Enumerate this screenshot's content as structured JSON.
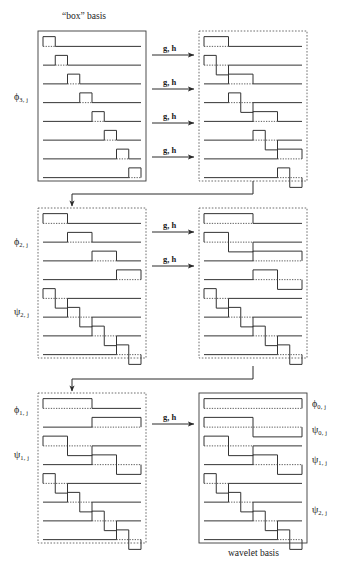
{
  "figure": {
    "title_top": "“box” basis",
    "caption_bottom": "wavelet basis",
    "operator_label": "g, h"
  },
  "labels": {
    "phi3": "ϕ",
    "phi3_sub": "3, j",
    "phi2": "ϕ",
    "phi2_sub": "2, j",
    "psi2": "ψ",
    "psi2_sub": "2, j",
    "phi1": "ϕ",
    "phi1_sub": "1, j",
    "psi1": "ψ",
    "psi1_sub": "1, j",
    "phi0r": "ϕ",
    "phi0r_sub": "0, j",
    "psi0r": "ψ",
    "psi0r_sub": "0, j",
    "psi1r": "ψ",
    "psi1r_sub": "1, j",
    "psi2r": "ψ",
    "psi2r_sub": "2, j"
  },
  "colors": {
    "ink": "#2a2a2a",
    "solid_box": "#3a3a3a",
    "dashed_box": "#4a4a4a",
    "baseline": "#444444",
    "wave": "#333333"
  },
  "chart_data": {
    "type": "line",
    "xlabel": "",
    "ylabel": "",
    "panels": [
      {
        "name": "row1-left",
        "label": "ϕ 3, j",
        "border": "solid",
        "title": "“box” basis",
        "x": 38,
        "y": 31,
        "w": 108,
        "h": 150,
        "functions": [
          {
            "kind": "box",
            "start": 0.0,
            "width": 0.125,
            "sign": 1
          },
          {
            "kind": "box",
            "start": 0.125,
            "width": 0.125,
            "sign": 1
          },
          {
            "kind": "box",
            "start": 0.25,
            "width": 0.125,
            "sign": 1
          },
          {
            "kind": "box",
            "start": 0.375,
            "width": 0.125,
            "sign": 1
          },
          {
            "kind": "box",
            "start": 0.5,
            "width": 0.125,
            "sign": 1
          },
          {
            "kind": "box",
            "start": 0.625,
            "width": 0.125,
            "sign": 1
          },
          {
            "kind": "box",
            "start": 0.75,
            "width": 0.125,
            "sign": 1
          },
          {
            "kind": "box",
            "start": 0.875,
            "width": 0.125,
            "sign": 1
          }
        ]
      },
      {
        "name": "row1-right",
        "border": "dashed",
        "x": 199,
        "y": 31,
        "w": 108,
        "h": 150,
        "functions": [
          {
            "kind": "box",
            "start": 0.0,
            "width": 0.25,
            "sign": 1
          },
          {
            "kind": "wave",
            "start": 0.0,
            "width": 0.25,
            "sign": 1
          },
          {
            "kind": "box",
            "start": 0.25,
            "width": 0.25,
            "sign": 1
          },
          {
            "kind": "wave",
            "start": 0.25,
            "width": 0.25,
            "sign": 1
          },
          {
            "kind": "box",
            "start": 0.5,
            "width": 0.25,
            "sign": 1
          },
          {
            "kind": "wave",
            "start": 0.5,
            "width": 0.25,
            "sign": 1
          },
          {
            "kind": "box",
            "start": 0.75,
            "width": 0.25,
            "sign": 1
          },
          {
            "kind": "wave",
            "start": 0.75,
            "width": 0.25,
            "sign": 1
          }
        ]
      },
      {
        "name": "row2-left",
        "labels": [
          "ϕ 2, j",
          "ψ 2, j"
        ],
        "border": "dashed",
        "x": 38,
        "y": 208,
        "w": 108,
        "h": 150,
        "functions": [
          {
            "kind": "box",
            "start": 0.0,
            "width": 0.25,
            "sign": 1
          },
          {
            "kind": "box",
            "start": 0.25,
            "width": 0.25,
            "sign": 1
          },
          {
            "kind": "box",
            "start": 0.5,
            "width": 0.25,
            "sign": 1
          },
          {
            "kind": "box",
            "start": 0.75,
            "width": 0.25,
            "sign": 1
          },
          {
            "kind": "wave",
            "start": 0.0,
            "width": 0.25,
            "sign": 1
          },
          {
            "kind": "wave",
            "start": 0.25,
            "width": 0.25,
            "sign": 1
          },
          {
            "kind": "wave",
            "start": 0.5,
            "width": 0.25,
            "sign": 1
          },
          {
            "kind": "wave",
            "start": 0.75,
            "width": 0.25,
            "sign": 1
          }
        ]
      },
      {
        "name": "row2-right",
        "border": "dashed",
        "x": 199,
        "y": 208,
        "w": 108,
        "h": 150,
        "functions": [
          {
            "kind": "box",
            "start": 0.0,
            "width": 0.5,
            "sign": 1
          },
          {
            "kind": "wave",
            "start": 0.0,
            "width": 0.5,
            "sign": 1
          },
          {
            "kind": "box",
            "start": 0.5,
            "width": 0.5,
            "sign": 1
          },
          {
            "kind": "wave",
            "start": 0.5,
            "width": 0.5,
            "sign": 1
          },
          {
            "kind": "wave",
            "start": 0.0,
            "width": 0.25,
            "sign": 1
          },
          {
            "kind": "wave",
            "start": 0.25,
            "width": 0.25,
            "sign": 1
          },
          {
            "kind": "wave",
            "start": 0.5,
            "width": 0.25,
            "sign": 1
          },
          {
            "kind": "wave",
            "start": 0.75,
            "width": 0.25,
            "sign": 1
          }
        ]
      },
      {
        "name": "row3-left",
        "labels": [
          "ϕ 1, j",
          "ψ 1, j"
        ],
        "border": "dashed",
        "x": 38,
        "y": 393,
        "w": 108,
        "h": 150,
        "functions": [
          {
            "kind": "box",
            "start": 0.0,
            "width": 0.5,
            "sign": 1
          },
          {
            "kind": "box",
            "start": 0.5,
            "width": 0.5,
            "sign": 1
          },
          {
            "kind": "wave",
            "start": 0.0,
            "width": 0.5,
            "sign": 1
          },
          {
            "kind": "wave",
            "start": 0.5,
            "width": 0.5,
            "sign": 1
          },
          {
            "kind": "wave",
            "start": 0.0,
            "width": 0.25,
            "sign": 1
          },
          {
            "kind": "wave",
            "start": 0.25,
            "width": 0.25,
            "sign": 1
          },
          {
            "kind": "wave",
            "start": 0.5,
            "width": 0.25,
            "sign": 1
          },
          {
            "kind": "wave",
            "start": 0.75,
            "width": 0.25,
            "sign": 1
          }
        ]
      },
      {
        "name": "row3-right",
        "border": "solid",
        "caption": "wavelet basis",
        "labels": [
          "ϕ 0, j",
          "ψ 0, j",
          "ψ 1, j",
          "ψ 2, j"
        ],
        "x": 199,
        "y": 393,
        "w": 108,
        "h": 150,
        "functions": [
          {
            "kind": "box",
            "start": 0.0,
            "width": 1.0,
            "sign": 1
          },
          {
            "kind": "wave",
            "start": 0.0,
            "width": 1.0,
            "sign": 1
          },
          {
            "kind": "wave",
            "start": 0.0,
            "width": 0.5,
            "sign": 1
          },
          {
            "kind": "wave",
            "start": 0.5,
            "width": 0.5,
            "sign": 1
          },
          {
            "kind": "wave",
            "start": 0.0,
            "width": 0.25,
            "sign": 1
          },
          {
            "kind": "wave",
            "start": 0.25,
            "width": 0.25,
            "sign": 1
          },
          {
            "kind": "wave",
            "start": 0.5,
            "width": 0.25,
            "sign": 1
          },
          {
            "kind": "wave",
            "start": 0.75,
            "width": 0.25,
            "sign": 1
          }
        ]
      }
    ],
    "arrows": [
      {
        "name": "gh-1",
        "label": "g, h",
        "x1": 152,
        "y1": 55,
        "x2": 194,
        "y2": 55
      },
      {
        "name": "gh-2",
        "label": "g, h",
        "x1": 152,
        "y1": 89,
        "x2": 194,
        "y2": 89
      },
      {
        "name": "gh-3",
        "label": "g, h",
        "x1": 152,
        "y1": 123,
        "x2": 194,
        "y2": 123
      },
      {
        "name": "gh-4",
        "label": "g, h",
        "x1": 152,
        "y1": 157,
        "x2": 194,
        "y2": 157
      },
      {
        "name": "gh-5",
        "label": "g, h",
        "x1": 152,
        "y1": 232,
        "x2": 194,
        "y2": 232
      },
      {
        "name": "gh-6",
        "label": "g, h",
        "x1": 152,
        "y1": 266,
        "x2": 194,
        "y2": 266
      },
      {
        "name": "gh-7",
        "label": "g, h",
        "x1": 152,
        "y1": 424,
        "x2": 194,
        "y2": 424
      }
    ],
    "feedback_connectors": [
      {
        "name": "feedback-1",
        "from_x": 253,
        "from_y": 181,
        "corner_y": 194,
        "to_x": 72,
        "to_y": 206
      },
      {
        "name": "feedback-2",
        "from_x": 253,
        "from_y": 366,
        "corner_y": 379,
        "to_x": 72,
        "to_y": 391
      }
    ]
  }
}
